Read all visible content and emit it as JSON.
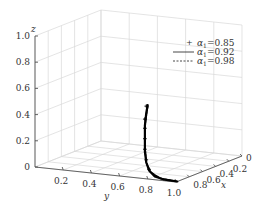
{
  "chart_data": {
    "type": "line",
    "projection": "3d",
    "title": "",
    "xlabel": "x",
    "ylabel": "y",
    "zlabel": "z",
    "xlim": [
      0,
      1
    ],
    "ylim": [
      0,
      1
    ],
    "zlim": [
      0,
      1
    ],
    "grid": true,
    "legend_position": "top-right",
    "x_ticks": [
      "0",
      "0.2",
      "0.4",
      "0.6",
      "0.8"
    ],
    "y_ticks": [
      "0.2",
      "0.4",
      "0.6",
      "0.8",
      "1.0"
    ],
    "z_ticks": [
      "0",
      "0.2",
      "0.4",
      "0.6",
      "0.8",
      "1.0"
    ],
    "series": [
      {
        "name": "a1=0.85",
        "label_symbol": "α",
        "label_sub": "1",
        "label_value": "=0.85",
        "style": "marker-plus",
        "points": [
          {
            "x": 0.98,
            "y": 0.78,
            "z": 0.55
          },
          {
            "x": 0.98,
            "y": 0.77,
            "z": 0.45
          },
          {
            "x": 0.98,
            "y": 0.77,
            "z": 0.38
          },
          {
            "x": 0.98,
            "y": 0.77,
            "z": 0.3
          },
          {
            "x": 0.98,
            "y": 0.77,
            "z": 0.22
          },
          {
            "x": 0.98,
            "y": 0.78,
            "z": 0.14
          },
          {
            "x": 0.98,
            "y": 0.8,
            "z": 0.07
          }
        ]
      },
      {
        "name": "a1=0.92",
        "label_symbol": "α",
        "label_sub": "1",
        "label_value": "=0.92",
        "style": "solid",
        "points": [
          {
            "x": 0.98,
            "y": 0.79,
            "z": 0.56
          },
          {
            "x": 0.98,
            "y": 0.78,
            "z": 0.5
          },
          {
            "x": 0.98,
            "y": 0.77,
            "z": 0.4
          },
          {
            "x": 0.98,
            "y": 0.77,
            "z": 0.3
          },
          {
            "x": 0.98,
            "y": 0.77,
            "z": 0.2
          },
          {
            "x": 0.98,
            "y": 0.78,
            "z": 0.12
          },
          {
            "x": 0.98,
            "y": 0.8,
            "z": 0.06
          },
          {
            "x": 0.98,
            "y": 0.84,
            "z": 0.02
          },
          {
            "x": 0.98,
            "y": 0.9,
            "z": 0.005
          },
          {
            "x": 0.98,
            "y": 1.0,
            "z": 0.0
          }
        ]
      },
      {
        "name": "a1=0.98",
        "label_symbol": "α",
        "label_sub": "1",
        "label_value": "=0.98",
        "style": "dashed",
        "points": [
          {
            "x": 0.98,
            "y": 0.79,
            "z": 0.55
          },
          {
            "x": 0.98,
            "y": 0.77,
            "z": 0.4
          },
          {
            "x": 0.98,
            "y": 0.77,
            "z": 0.25
          },
          {
            "x": 0.98,
            "y": 0.78,
            "z": 0.12
          },
          {
            "x": 0.98,
            "y": 0.81,
            "z": 0.05
          },
          {
            "x": 0.98,
            "y": 0.88,
            "z": 0.01
          },
          {
            "x": 0.98,
            "y": 1.0,
            "z": 0.0
          }
        ]
      }
    ]
  }
}
